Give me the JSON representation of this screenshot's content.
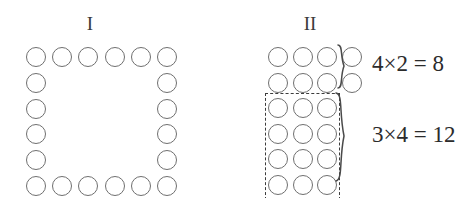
{
  "figure": {
    "background_color": "#ffffff",
    "circle_stroke_color": "#6f6f6f",
    "dashed_box_color": "#3c3c3c",
    "text_color": "#2b2b2b",
    "panels": [
      {
        "id": "panel-one",
        "label": "I",
        "description": "square ring of circles, 6 by 6 outline",
        "rows": 6,
        "columns": 6,
        "total_circles": 20
      },
      {
        "id": "panel-two",
        "label": "II",
        "description": "same circles regrouped into two rectangles",
        "groups": [
          {
            "id": "group-top",
            "columns": 4,
            "rows": 2,
            "equation": "4×2 = 8",
            "count": 8,
            "boxed": false
          },
          {
            "id": "group-bottom",
            "columns": 3,
            "rows": 4,
            "equation": "3×4 = 12",
            "count": 12,
            "boxed": true
          }
        ]
      }
    ]
  },
  "chart_data": {
    "type": "table",
    "title": "",
    "series": [
      {
        "name": "Figure I ring",
        "values": [
          20
        ]
      },
      {
        "name": "Figure II top group (4×2)",
        "values": [
          8
        ]
      },
      {
        "name": "Figure II dashed group (3×4)",
        "values": [
          12
        ]
      }
    ],
    "categories": [
      "circle count"
    ]
  }
}
